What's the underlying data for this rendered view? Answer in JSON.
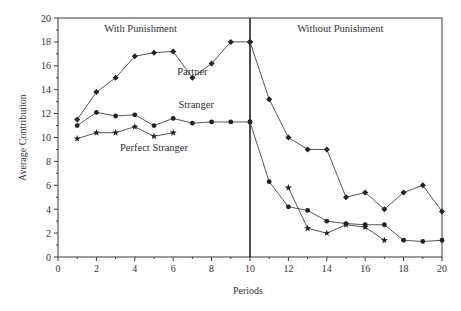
{
  "chart_data": {
    "type": "line",
    "title": "",
    "xlabel": "Periods",
    "ylabel": "Average Contribution",
    "xlim": [
      0,
      20
    ],
    "ylim": [
      0,
      20
    ],
    "xticks": [
      0,
      2,
      4,
      6,
      8,
      10,
      12,
      14,
      16,
      18,
      20
    ],
    "yticks": [
      0,
      2,
      4,
      6,
      8,
      10,
      12,
      14,
      16,
      18,
      20
    ],
    "grid": false,
    "divider_x": 10,
    "annotations": [
      {
        "text": "With Punishment",
        "x": 4.3,
        "y": 18.8
      },
      {
        "text": "Without Punishment",
        "x": 14.7,
        "y": 18.8
      },
      {
        "text": "Partner",
        "x": 7.0,
        "y": 15.2
      },
      {
        "text": "Stranger",
        "x": 7.2,
        "y": 12.5
      },
      {
        "text": "Perfect Stranger",
        "x": 5.0,
        "y": 8.9
      }
    ],
    "series": [
      {
        "name": "Partner",
        "marker": "diamond",
        "x": [
          1,
          2,
          3,
          4,
          5,
          6,
          7,
          8,
          9,
          10,
          10,
          11,
          12,
          13,
          14,
          15,
          16,
          17,
          18,
          19,
          20
        ],
        "values": [
          11.5,
          13.8,
          15.0,
          16.8,
          17.1,
          17.2,
          15.0,
          16.2,
          18.0,
          18.0,
          18.0,
          13.2,
          10.0,
          9.0,
          9.0,
          5.0,
          5.4,
          4.0,
          5.4,
          6.0,
          3.8
        ]
      },
      {
        "name": "Stranger",
        "marker": "circle",
        "x": [
          1,
          2,
          3,
          4,
          5,
          6,
          7,
          8,
          9,
          10,
          10,
          11,
          12,
          13,
          14,
          15,
          16,
          17,
          18,
          19,
          20
        ],
        "values": [
          11.0,
          12.1,
          11.8,
          11.9,
          11.0,
          11.6,
          11.2,
          11.3,
          11.3,
          11.3,
          11.3,
          6.3,
          4.2,
          3.9,
          3.0,
          2.8,
          2.7,
          2.7,
          1.4,
          1.3,
          1.4
        ]
      },
      {
        "name": "Perfect Stranger (with punishment)",
        "marker": "star",
        "x": [
          1,
          2,
          3,
          4,
          5,
          6
        ],
        "values": [
          9.9,
          10.4,
          10.4,
          10.9,
          10.1,
          10.4
        ]
      },
      {
        "name": "Perfect Stranger (without punishment)",
        "marker": "star",
        "x": [
          12,
          13,
          14,
          15,
          16,
          17
        ],
        "values": [
          5.8,
          2.4,
          2.0,
          2.7,
          2.5,
          1.4
        ]
      }
    ]
  }
}
